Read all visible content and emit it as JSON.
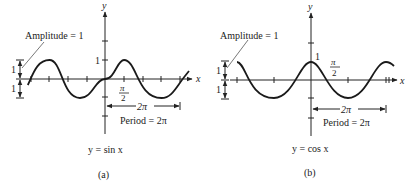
{
  "figure": {
    "panels": [
      {
        "id": "a",
        "function": "sin",
        "caption": "(a)",
        "equation": "y = sin x",
        "amplitude_label": "Amplitude = 1",
        "amp_unit_top": "1",
        "amp_unit_bottom": "1",
        "y_tick_label": "1",
        "x_tick_label_num": "π",
        "x_tick_label_den": "2",
        "period_span_label": "2π",
        "period_label": "Period = 2π",
        "x_axis_label": "x",
        "y_axis_label": "y"
      },
      {
        "id": "b",
        "function": "cos",
        "caption": "(b)",
        "equation": "y = cos x",
        "amplitude_label": "Amplitude = 1",
        "amp_unit_top": "1",
        "amp_unit_bottom": "1",
        "y_tick_label": "1",
        "x_tick_label_num": "π",
        "x_tick_label_den": "2",
        "period_span_label": "2π",
        "period_label": "Period = 2π",
        "x_axis_label": "x",
        "y_axis_label": "y"
      }
    ],
    "colors": {
      "ink": "#222222",
      "curve": "#1a1a1a"
    }
  }
}
